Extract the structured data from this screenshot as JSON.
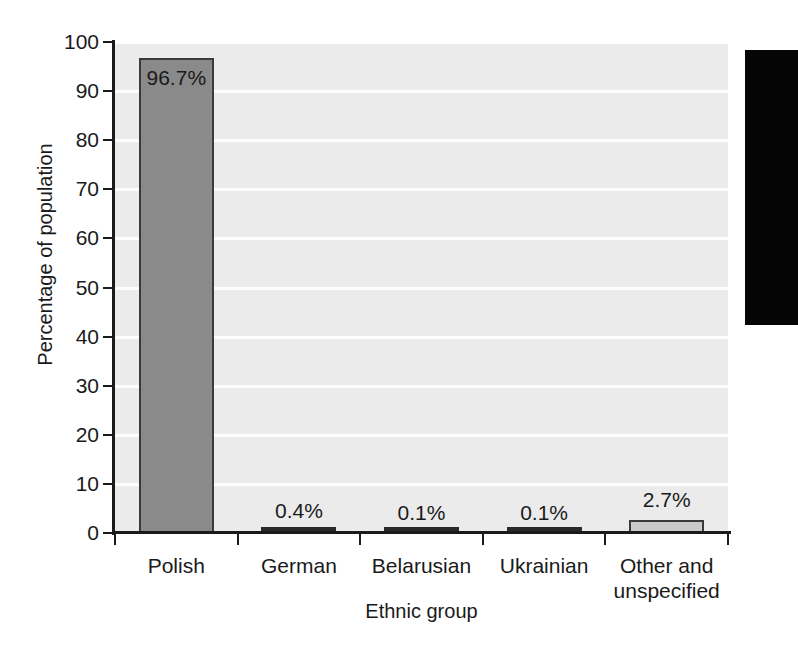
{
  "chart_data": {
    "type": "bar",
    "title": "",
    "subtitle": "",
    "xlabel": "Ethnic group",
    "ylabel": "Percentage of population",
    "categories": [
      "Polish",
      "German",
      "Belarusian",
      "Ukrainian",
      "Other and\nunspecified"
    ],
    "category_labels": [
      {
        "line1": "Polish",
        "line2": ""
      },
      {
        "line1": "German",
        "line2": ""
      },
      {
        "line1": "Belarusian",
        "line2": ""
      },
      {
        "line1": "Ukrainian",
        "line2": ""
      },
      {
        "line1": "Other and",
        "line2": "unspecified"
      }
    ],
    "values": [
      96.7,
      0.4,
      0.1,
      0.1,
      2.7
    ],
    "value_labels": [
      "96.7%",
      "0.4%",
      "0.1%",
      "0.1%",
      "2.7%"
    ],
    "ylim": [
      0,
      100
    ],
    "yticks": [
      0,
      10,
      20,
      30,
      40,
      50,
      60,
      70,
      80,
      90,
      100
    ],
    "ytick_labels": [
      "0",
      "10",
      "20",
      "30",
      "40",
      "50",
      "60",
      "70",
      "80",
      "90",
      "100"
    ],
    "grid": true,
    "grid_color": "#fdfdfd",
    "legend": "none",
    "plot_background": "#ebebeb",
    "bar_fills": [
      "#8a8a8a",
      "#2b2b2b",
      "#2b2b2b",
      "#2b2b2b",
      "#c9c9c9"
    ],
    "bar_border_color": "#3a3a3a",
    "axis_color": "#1a1a1a",
    "text_color": "#1a1a1a"
  },
  "artifact": {
    "name": "scan-edge-artifact",
    "color": "#050505"
  }
}
